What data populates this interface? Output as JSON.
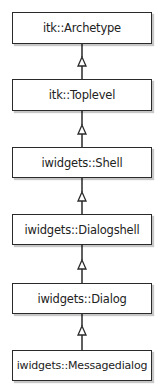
{
  "diagram": {
    "type": "class-inheritance",
    "direction": "bottom-to-top",
    "classes": [
      {
        "name": "itk::Archetype"
      },
      {
        "name": "itk::Toplevel"
      },
      {
        "name": "iwidgets::Shell"
      },
      {
        "name": "iwidgets::Dialogshell"
      },
      {
        "name": "iwidgets::Dialog"
      },
      {
        "name": "iwidgets::Messagedialog"
      }
    ],
    "relations": [
      {
        "from": "itk::Toplevel",
        "to": "itk::Archetype",
        "kind": "inherits"
      },
      {
        "from": "iwidgets::Shell",
        "to": "itk::Toplevel",
        "kind": "inherits"
      },
      {
        "from": "iwidgets::Dialogshell",
        "to": "iwidgets::Shell",
        "kind": "inherits"
      },
      {
        "from": "iwidgets::Dialog",
        "to": "iwidgets::Dialogshell",
        "kind": "inherits"
      },
      {
        "from": "iwidgets::Messagedialog",
        "to": "iwidgets::Dialog",
        "kind": "inherits"
      }
    ],
    "colors": {
      "stroke": "#2a2a2a",
      "fill": "#ffffff",
      "text": "#222222"
    }
  }
}
